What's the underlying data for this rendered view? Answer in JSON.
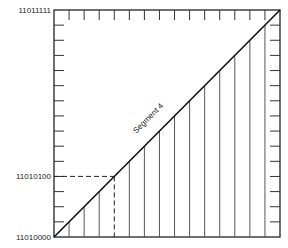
{
  "diagram": {
    "y_labels": {
      "top": "11011111",
      "mid": "11010100",
      "bottom": "11010000"
    },
    "segment_label": "Segment 4",
    "colors": {
      "line": "#222222",
      "thin": "#555555",
      "background": "#ffffff"
    },
    "grid": {
      "divisions": 15,
      "dashed_level_steps": 4
    }
  },
  "chart_data": {
    "type": "line",
    "title": "",
    "xlabel": "",
    "ylabel": "",
    "y_tick_labels": [
      "11010000",
      "11010100",
      "11011111"
    ],
    "series": [
      {
        "name": "Segment 4",
        "x": [
          0,
          15
        ],
        "y": [
          0,
          15
        ]
      }
    ],
    "annotations": [
      {
        "text": "Segment 4",
        "position": "along diagonal"
      },
      {
        "text": "11010100",
        "type": "dashed guide",
        "x": 4,
        "y": 4
      }
    ],
    "ylim": [
      0,
      15
    ],
    "xlim": [
      0,
      15
    ],
    "grid": false
  }
}
